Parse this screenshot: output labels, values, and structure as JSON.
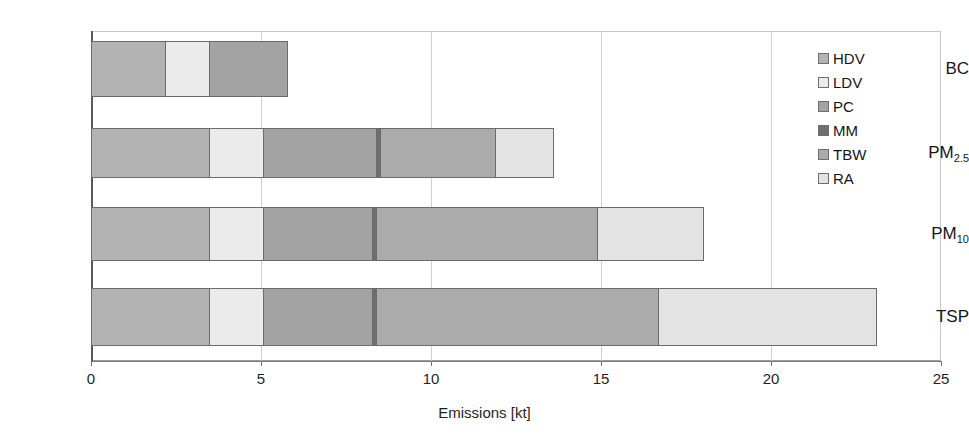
{
  "chart_data": {
    "type": "bar",
    "orientation": "horizontal",
    "stacked": true,
    "title": "",
    "subtitle": "",
    "xlabel": "Emissions [kt]",
    "ylabel": "",
    "xlim": [
      0,
      25
    ],
    "xticks": [
      0,
      5,
      10,
      15,
      20,
      25
    ],
    "xtick_labels": [
      "0",
      "5",
      "10",
      "15",
      "20",
      "25"
    ],
    "grid": true,
    "grid_axis": "x",
    "legend_position": "top-right",
    "categories": [
      "BC",
      "PM2.5",
      "PM10",
      "TSP"
    ],
    "category_labels_html": [
      "BC",
      "PM<sub>2.5</sub>",
      "PM<sub>10</sub>",
      "TSP"
    ],
    "series": [
      {
        "name": "HDV",
        "color": "#b3b3b3",
        "values": [
          2.2,
          3.5,
          3.5,
          3.5
        ]
      },
      {
        "name": "LDV",
        "color": "#ebebeb",
        "values": [
          1.3,
          1.6,
          1.6,
          1.6
        ]
      },
      {
        "name": "PC",
        "color": "#a3a3a3",
        "values": [
          2.3,
          3.3,
          3.2,
          3.2
        ]
      },
      {
        "name": "MM",
        "color": "#6e6e6e",
        "values": [
          0.0,
          0.12,
          0.12,
          0.12
        ]
      },
      {
        "name": "TBW",
        "color": "#ababab",
        "values": [
          0.0,
          3.4,
          6.5,
          8.3
        ]
      },
      {
        "name": "RA",
        "color": "#e3e3e3",
        "values": [
          0.0,
          1.7,
          3.1,
          6.4
        ]
      }
    ],
    "totals": [
      5.8,
      13.6,
      18.0,
      23.1
    ],
    "units": "kt"
  },
  "legend": {
    "items": [
      {
        "label": "HDV",
        "color": "#b3b3b3"
      },
      {
        "label": "LDV",
        "color": "#ebebeb"
      },
      {
        "label": "PC",
        "color": "#a3a3a3"
      },
      {
        "label": "MM",
        "color": "#6e6e6e"
      },
      {
        "label": "TBW",
        "color": "#ababab"
      },
      {
        "label": "RA",
        "color": "#e3e3e3"
      }
    ]
  },
  "axis": {
    "x_title": "Emissions [kt]",
    "x_tick_labels": [
      "0",
      "5",
      "10",
      "15",
      "20",
      "25"
    ],
    "y_tick_labels": [
      "BC",
      "PM2.5",
      "PM10",
      "TSP"
    ]
  },
  "geometry": {
    "plot_left_px": 91,
    "plot_right_px": 941,
    "plot_top_px": 31,
    "plot_bottom_px": 361,
    "x_max": 25,
    "bar_rows": [
      {
        "category": "BC",
        "top_px": 41,
        "height_px": 56
      },
      {
        "category": "PM2.5",
        "top_px": 128,
        "height_px": 50
      },
      {
        "category": "PM10",
        "top_px": 207,
        "height_px": 54
      },
      {
        "category": "TSP",
        "top_px": 288,
        "height_px": 58
      }
    ]
  }
}
